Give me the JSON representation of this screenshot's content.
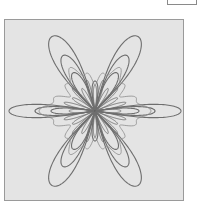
{
  "figure": {
    "type": "polar-curve-overlay",
    "panel_color": "#e4e4e4",
    "border_color": "#9a9a9a",
    "stroke_color": "#6e6e6e",
    "center": [
      90,
      91
    ],
    "curves": [
      {
        "name": "outer-diagonal-lobes",
        "petals": 4,
        "angles_deg": [
          60,
          120,
          240,
          300
        ],
        "length": 86,
        "width": 15
      },
      {
        "name": "outer-horizontal-lobes",
        "petals": 2,
        "angles_deg": [
          0,
          180
        ],
        "length": 86,
        "width": 9
      },
      {
        "name": "mid-diagonal-lobes",
        "petals": 4,
        "angles_deg": [
          60,
          120,
          240,
          300
        ],
        "length": 64,
        "width": 10
      },
      {
        "name": "mid-horizontal-lobes",
        "petals": 2,
        "angles_deg": [
          0,
          180
        ],
        "length": 60,
        "width": 6
      },
      {
        "name": "inner-diagonal-lobes",
        "petals": 4,
        "angles_deg": [
          60,
          120,
          240,
          300
        ],
        "length": 44,
        "width": 7
      },
      {
        "name": "inner-horizontal-lobes",
        "petals": 2,
        "angles_deg": [
          0,
          180
        ],
        "length": 44,
        "width": 4
      },
      {
        "name": "vertical-lobes",
        "petals": 2,
        "angles_deg": [
          90,
          270
        ],
        "length": 30,
        "width": 4
      },
      {
        "name": "spokes",
        "count": 24,
        "length": 26
      }
    ]
  },
  "corner_box": {
    "label": ""
  }
}
